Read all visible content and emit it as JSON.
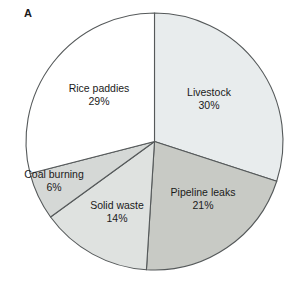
{
  "figure": {
    "panel_label": "A",
    "background_color": "#ffffff",
    "stroke_color": "#55595a"
  },
  "chart_data": {
    "type": "pie",
    "title": "",
    "subtitle": "",
    "xlabel": "",
    "ylabel": "",
    "legend_position": "none",
    "grid": false,
    "units": "%",
    "start_angle_deg": 0,
    "direction": "clockwise",
    "total": 100,
    "categories": [
      "Livestock",
      "Pipeline leaks",
      "Solid waste",
      "Coal burning",
      "Rice paddies"
    ],
    "values": [
      30,
      21,
      14,
      6,
      29
    ],
    "value_labels": [
      "30%",
      "21%",
      "14%",
      "6%",
      "29%"
    ],
    "colors": [
      "#e8eced",
      "#c8cac5",
      "#dfe2e0",
      "#d5d8d6",
      "#ffffff"
    ],
    "slices": [
      {
        "label": "Livestock",
        "value": 30,
        "value_label": "30%",
        "color": "#e8eced",
        "label_x": 209,
        "label_y": 98
      },
      {
        "label": "Pipeline leaks",
        "value": 21,
        "value_label": "21%",
        "color": "#c8cac5",
        "label_x": 203,
        "label_y": 198
      },
      {
        "label": "Solid waste",
        "value": 14,
        "value_label": "14%",
        "color": "#dfe2e0",
        "label_x": 117,
        "label_y": 211
      },
      {
        "label": "Coal burning",
        "value": 6,
        "value_label": "6%",
        "color": "#d5d8d6",
        "label_x": 54,
        "label_y": 180
      },
      {
        "label": "Rice paddies",
        "value": 29,
        "value_label": "29%",
        "color": "#ffffff",
        "label_x": 99,
        "label_y": 94
      }
    ],
    "geometry": {
      "center_x": 154.5,
      "center_y": 141.5,
      "radius": 128.5
    }
  }
}
